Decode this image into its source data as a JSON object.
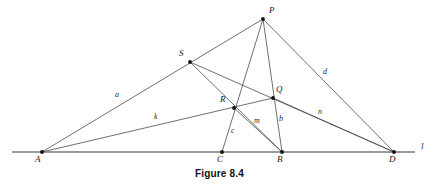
{
  "figure": {
    "caption": "Figure 8.4",
    "baseline_label": "l",
    "stroke_color": "#4a4a4a",
    "baseline_color": "#9a9a9a",
    "vertex_color": "#111111",
    "background": "#ffffff"
  },
  "points": [
    {
      "name": "A",
      "label": "A",
      "x": 42,
      "y": 152,
      "label_x": 35,
      "label_y": 156
    },
    {
      "name": "C",
      "label": "C",
      "x": 222,
      "y": 152,
      "label_x": 217,
      "label_y": 156
    },
    {
      "name": "B",
      "label": "B",
      "x": 282,
      "y": 152,
      "label_x": 277,
      "label_y": 156
    },
    {
      "name": "D",
      "label": "D",
      "x": 394,
      "y": 152,
      "label_x": 390,
      "label_y": 156
    },
    {
      "name": "P",
      "label": "P",
      "x": 263,
      "y": 19,
      "label_x": 269,
      "label_y": 7
    },
    {
      "name": "S",
      "label": "S",
      "x": 190,
      "y": 62,
      "label_x": 180,
      "label_y": 50
    },
    {
      "name": "Q",
      "label": "Q",
      "x": 273,
      "y": 98,
      "label_x": 276,
      "label_y": 86
    },
    {
      "name": "R",
      "label": "R",
      "x": 234,
      "y": 108,
      "label_x": 221,
      "label_y": 96
    }
  ],
  "segments": [
    {
      "name": "A-to-P",
      "from": "A",
      "to": "P",
      "label": "a"
    },
    {
      "name": "P-to-D",
      "from": "P",
      "to": "D",
      "label": "d"
    },
    {
      "name": "A-to-D-through-Q",
      "from": "A",
      "to": "D",
      "label": "k / n"
    },
    {
      "name": "S-to-B",
      "from": "S",
      "to": "B",
      "label": ""
    },
    {
      "name": "P-to-C",
      "from": "P",
      "to": "C",
      "label": ""
    },
    {
      "name": "P-to-B",
      "from": "P",
      "to": "B",
      "label": ""
    },
    {
      "name": "R-to-C",
      "from": "R",
      "to": "C",
      "label": "c"
    },
    {
      "name": "R-to-B",
      "from": "R",
      "to": "B",
      "label": "m"
    },
    {
      "name": "Q-to-B",
      "from": "Q",
      "to": "B",
      "label": "b"
    }
  ],
  "segment_labels": [
    {
      "name": "a",
      "text": "a",
      "x": 115,
      "y": 92
    },
    {
      "name": "k",
      "text": "k",
      "x": 154,
      "y": 113
    },
    {
      "name": "c",
      "text": "c",
      "x": 231,
      "y": 128
    },
    {
      "name": "m",
      "text": "m",
      "x": 255,
      "y": 118
    },
    {
      "name": "b",
      "text": "b",
      "x": 279,
      "y": 116
    },
    {
      "name": "n",
      "text": "n",
      "x": 318,
      "y": 109
    },
    {
      "name": "d",
      "text": "d",
      "x": 323,
      "y": 69
    }
  ],
  "baseline": {
    "x1": 12,
    "x2": 415,
    "y": 152,
    "label": "l",
    "label_x": 421,
    "label_y": 143
  }
}
